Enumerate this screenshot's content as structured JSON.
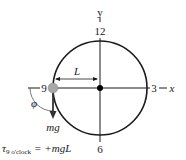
{
  "diagram": {
    "axes": {
      "y_label": "y",
      "x_label": "x"
    },
    "clock_numbers": {
      "twelve": "12",
      "three": "3",
      "six": "6",
      "nine": "9"
    },
    "length_label": "L",
    "angle_label": "φ",
    "force_label": "mg",
    "equation": {
      "tau": "τ",
      "subscript": "9 o'clock",
      "rhs": "= +mgL"
    },
    "colors": {
      "line": "#1a1a1a",
      "ball": "#a8a8a8",
      "center_dot": "#000000"
    }
  }
}
